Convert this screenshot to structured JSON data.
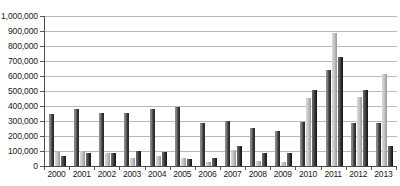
{
  "chart_data": {
    "type": "bar",
    "title": "",
    "subtitle": "",
    "xlabel": "",
    "ylabel": "",
    "ylim": [
      0,
      1000000
    ],
    "ytick_step": 100000,
    "grid": true,
    "legend": false,
    "legend_position": "none",
    "orientation": "vertical",
    "grouping": "grouped",
    "categories": [
      "2000",
      "2001",
      "2002",
      "2003",
      "2004",
      "2005",
      "2006",
      "2007",
      "2008",
      "2009",
      "2010",
      "2011",
      "2012",
      "2013"
    ],
    "ytick_labels": [
      "0",
      "100,000",
      "200,000",
      "300,000",
      "400,000",
      "500,000",
      "600,000",
      "700,000",
      "800,000",
      "900,000",
      "1,000,000"
    ],
    "ytick_values": [
      0,
      100000,
      200000,
      300000,
      400000,
      500000,
      600000,
      700000,
      800000,
      900000,
      1000000
    ],
    "series": [
      {
        "name": "Series 1",
        "color": "#3a3a3a",
        "values": [
          345000,
          378000,
          355000,
          352000,
          380000,
          395000,
          290000,
          300000,
          255000,
          235000,
          295000,
          640000,
          290000,
          290000
        ]
      },
      {
        "name": "Series 2",
        "color": "#c9c9c9",
        "values": [
          95000,
          98000,
          88000,
          55000,
          68000,
          55000,
          30000,
          110000,
          35000,
          25000,
          455000,
          890000,
          460000,
          615000
        ]
      },
      {
        "name": "Series 3",
        "color": "#242424",
        "values": [
          65000,
          85000,
          88000,
          102000,
          95000,
          48000,
          55000,
          135000,
          85000,
          90000,
          510000,
          725000,
          510000,
          135000
        ]
      }
    ]
  }
}
